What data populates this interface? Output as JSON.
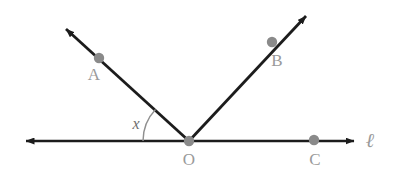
{
  "figure": {
    "type": "geometry-diagram",
    "background_color": "#ffffff",
    "stroke_color": "#1c1c1c",
    "point_color": "#8a8a8a",
    "label_color": "#9a9a9a",
    "arc_color": "#8f8f8f"
  },
  "vertex": {
    "name": "O",
    "label": "O",
    "x": 189,
    "y": 141,
    "label_x": 189,
    "label_y": 165
  },
  "line": {
    "name": "l",
    "label": "ℓ",
    "label_x": 370,
    "label_y": 147,
    "y": 141,
    "left_end_x": 22,
    "right_end_x": 358,
    "double_arrow": true
  },
  "rays": [
    {
      "name": "OA",
      "from": "O",
      "to": "A",
      "tip_x": 62,
      "tip_y": 26,
      "arrow": true
    },
    {
      "name": "OB",
      "from": "O",
      "to": "B",
      "tip_x": 310,
      "tip_y": 12,
      "arrow": true
    }
  ],
  "points": [
    {
      "label": "A",
      "x": 99,
      "y": 58,
      "label_x": 94,
      "label_y": 80,
      "on": "ray-oa"
    },
    {
      "label": "B",
      "x": 272,
      "y": 42,
      "label_x": 277,
      "label_y": 66,
      "on": "ray-ob"
    },
    {
      "label": "C",
      "x": 314,
      "y": 140,
      "label_x": 315,
      "label_y": 165,
      "on": "line-l"
    }
  ],
  "angle": {
    "label": "x",
    "label_x": 136,
    "label_y": 129,
    "vertex": "O",
    "between": [
      "line-l-left",
      "ray-oa"
    ],
    "arc_radius": 46,
    "arc_start_x": 143,
    "arc_start_y": 141,
    "arc_end_x": 156,
    "arc_end_y": 107
  }
}
